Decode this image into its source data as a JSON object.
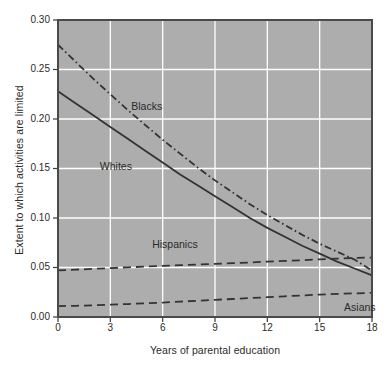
{
  "chart_data": {
    "type": "line",
    "title": "",
    "xlabel": "Years of parental education",
    "ylabel": "Extent to which activities are limited",
    "xlim": [
      0,
      18
    ],
    "ylim": [
      0.0,
      0.3
    ],
    "xticks": [
      "0",
      "3",
      "6",
      "9",
      "12",
      "15",
      "18"
    ],
    "xtick_values": [
      0,
      3,
      6,
      9,
      12,
      15,
      18
    ],
    "yticks": [
      "0.00",
      "0.05",
      "0.10",
      "0.15",
      "0.20",
      "0.25",
      "0.30"
    ],
    "ytick_values": [
      0.0,
      0.05,
      0.1,
      0.15,
      0.2,
      0.25,
      0.3
    ],
    "grid": true,
    "grid_color": "#ffffff",
    "plot_background": "#adadad",
    "legend_position": "inline-annotations",
    "x": [
      0,
      1,
      2,
      3,
      4,
      5,
      6,
      7,
      8,
      9,
      10,
      11,
      12,
      13,
      14,
      15,
      16,
      17,
      18
    ],
    "series": [
      {
        "name": "Blacks",
        "style": "dash-dot",
        "color": "#333333",
        "values": [
          0.275,
          0.258,
          0.241,
          0.225,
          0.209,
          0.194,
          0.179,
          0.165,
          0.151,
          0.138,
          0.126,
          0.114,
          0.103,
          0.093,
          0.083,
          0.074,
          0.066,
          0.058,
          0.047
        ],
        "label_x": 4.2,
        "label_y": 0.212
      },
      {
        "name": "Whites",
        "style": "solid",
        "color": "#333333",
        "values": [
          0.228,
          0.216,
          0.204,
          0.192,
          0.18,
          0.168,
          0.156,
          0.144,
          0.133,
          0.122,
          0.111,
          0.1,
          0.09,
          0.081,
          0.072,
          0.064,
          0.056,
          0.049,
          0.042
        ],
        "label_x": 2.4,
        "label_y": 0.152
      },
      {
        "name": "Hispanics",
        "style": "dashed",
        "color": "#333333",
        "values": [
          0.047,
          0.0478,
          0.0486,
          0.0494,
          0.0502,
          0.0509,
          0.0516,
          0.0523,
          0.053,
          0.0537,
          0.0544,
          0.0551,
          0.0559,
          0.0566,
          0.0574,
          0.0582,
          0.059,
          0.0597,
          0.06
        ],
        "label_x": 5.4,
        "label_y": 0.0725
      },
      {
        "name": "Asians",
        "style": "dashed",
        "color": "#333333",
        "values": [
          0.011,
          0.0113,
          0.0118,
          0.0124,
          0.0131,
          0.0138,
          0.0146,
          0.0155,
          0.0164,
          0.0173,
          0.0182,
          0.0191,
          0.02,
          0.0209,
          0.0218,
          0.0226,
          0.0233,
          0.0239,
          0.0244
        ],
        "label_x": 16.4,
        "label_y": 0.0095
      }
    ]
  }
}
